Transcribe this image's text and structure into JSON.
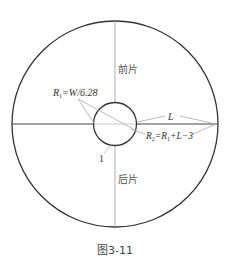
{
  "figure": {
    "caption": "图3-11",
    "colors": {
      "outline": "#333333",
      "thin_line": "#999999",
      "leader": "#aaaaaa",
      "text": "#333333"
    },
    "labels": {
      "front_piece": "前片",
      "back_piece": "后片",
      "r1_formula_prefix": "R",
      "r1_formula_sub": "1",
      "r1_formula_rest": "=W/6.28",
      "l_label": "L",
      "r2_formula_prefix": "R",
      "r2_formula_sub": "2",
      "r2_formula_mid": "=R",
      "r2_formula_sub2": "1",
      "r2_formula_rest": "+L−3",
      "point_label": "1"
    },
    "geometry": {
      "outer_circle": {
        "cx": 115,
        "cy": 124,
        "r": 103
      },
      "inner_circle": {
        "cx": 115,
        "cy": 124,
        "r": 21.5
      }
    }
  }
}
